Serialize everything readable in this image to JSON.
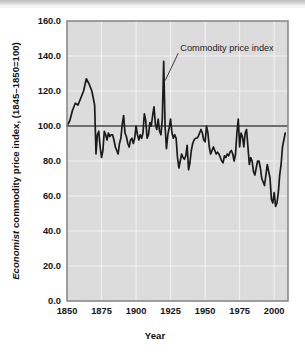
{
  "figure": {
    "background": "#ffffff",
    "plot_background": "#dcdcdc",
    "grid_color": "#f2f2f2",
    "frame_color": "#8a8a8a",
    "line_color": "#1a1a1a",
    "reference_line_color": "#6e6e6e"
  },
  "chart_data": {
    "type": "line",
    "title": "",
    "xlabel": "Year",
    "ylabel": "Economist commodity price index, (1845–1850=100)",
    "ylabel_italic_prefix": "Economist",
    "ylabel_rest": " commodity price index, (1845–1850=100)",
    "xlim": [
      1850,
      2010
    ],
    "ylim": [
      0.0,
      160.0
    ],
    "xticks": [
      1850,
      1875,
      1900,
      1925,
      1950,
      1975,
      2000
    ],
    "xticklabels": [
      "1850",
      "1875",
      "1900",
      "1925",
      "1950",
      "1975",
      "2000"
    ],
    "yticks": [
      0.0,
      20.0,
      40.0,
      60.0,
      80.0,
      100.0,
      120.0,
      140.0,
      160.0
    ],
    "yticklabels": [
      "0.0",
      "20.0",
      "40.0",
      "60.0",
      "80.0",
      "100.0",
      "120.0",
      "140.0",
      "160.0"
    ],
    "grid": true,
    "legend": "none",
    "reference_line": {
      "y": 100.0,
      "label": "index base = 100"
    },
    "annotations": [
      {
        "text": "Commodity price index",
        "x": 1932,
        "y": 143,
        "points_to_x": 1920,
        "points_to_y": 126
      }
    ],
    "series": [
      {
        "name": "Commodity price index",
        "x": [
          1850,
          1852,
          1854,
          1856,
          1858,
          1860,
          1862,
          1864,
          1866,
          1868,
          1870,
          1871,
          1872,
          1873,
          1874,
          1875,
          1876,
          1877,
          1878,
          1879,
          1880,
          1881,
          1882,
          1883,
          1884,
          1885,
          1886,
          1887,
          1888,
          1889,
          1890,
          1891,
          1892,
          1893,
          1894,
          1895,
          1896,
          1897,
          1898,
          1899,
          1900,
          1901,
          1902,
          1903,
          1904,
          1905,
          1906,
          1907,
          1908,
          1909,
          1910,
          1911,
          1912,
          1913,
          1914,
          1915,
          1916,
          1917,
          1918,
          1919,
          1920,
          1921,
          1922,
          1923,
          1924,
          1925,
          1926,
          1927,
          1928,
          1929,
          1930,
          1931,
          1932,
          1933,
          1934,
          1935,
          1936,
          1937,
          1938,
          1939,
          1940,
          1941,
          1942,
          1943,
          1944,
          1945,
          1946,
          1947,
          1948,
          1949,
          1950,
          1951,
          1952,
          1953,
          1954,
          1955,
          1956,
          1957,
          1958,
          1959,
          1960,
          1961,
          1962,
          1963,
          1964,
          1965,
          1966,
          1967,
          1968,
          1969,
          1970,
          1971,
          1972,
          1973,
          1974,
          1975,
          1976,
          1977,
          1978,
          1979,
          1980,
          1981,
          1982,
          1983,
          1984,
          1985,
          1986,
          1987,
          1988,
          1989,
          1990,
          1991,
          1992,
          1993,
          1994,
          1995,
          1996,
          1997,
          1998,
          1999,
          2000,
          2001,
          2002,
          2003,
          2004,
          2005,
          2006,
          2007,
          2008
        ],
        "values": [
          100,
          103,
          109,
          113,
          112,
          116,
          120,
          127,
          124,
          120,
          112,
          84,
          95,
          97,
          88,
          82,
          86,
          97,
          95,
          92,
          96,
          94,
          95,
          95,
          92,
          88,
          86,
          84,
          90,
          93,
          101,
          106,
          96,
          94,
          90,
          88,
          92,
          93,
          90,
          93,
          100,
          95,
          92,
          95,
          93,
          96,
          107,
          103,
          93,
          95,
          102,
          100,
          106,
          111,
          101,
          98,
          104,
          97,
          95,
          104,
          137,
          100,
          87,
          95,
          99,
          104,
          96,
          93,
          95,
          93,
          82,
          76,
          80,
          84,
          82,
          81,
          83,
          89,
          75,
          79,
          86,
          90,
          92,
          93,
          93,
          94,
          96,
          98,
          96,
          92,
          91,
          100,
          96,
          88,
          84,
          86,
          88,
          86,
          84,
          85,
          84,
          82,
          80,
          79,
          83,
          82,
          84,
          83,
          85,
          86,
          84,
          80,
          84,
          96,
          104,
          88,
          96,
          94,
          88,
          96,
          98,
          88,
          78,
          82,
          80,
          74,
          72,
          76,
          80,
          80,
          76,
          70,
          68,
          66,
          72,
          78,
          74,
          70,
          58,
          56,
          62,
          54,
          56,
          62,
          72,
          78,
          88,
          92,
          96
        ]
      }
    ]
  }
}
